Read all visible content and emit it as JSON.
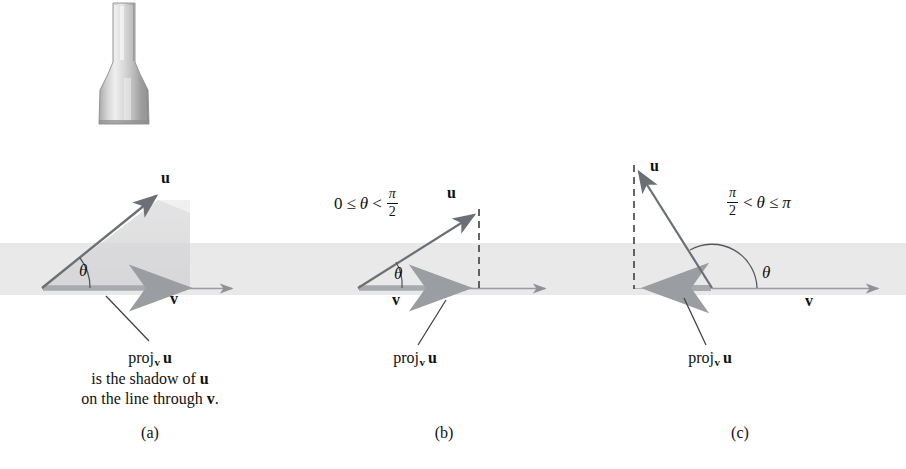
{
  "figure": {
    "colors": {
      "vector_u": "#6b6f76",
      "vector_v": "#8e9196",
      "projection": "#9a9da1",
      "band": "#e9e9ea",
      "text": "#111111",
      "dashed": "#3a3a3a"
    },
    "lamp": {
      "name": "flashlight-light-source"
    }
  },
  "panels": [
    {
      "id": "a",
      "letter": "(a)",
      "label_u": "u",
      "label_v": "v",
      "label_theta": "θ",
      "inequality": null,
      "has_dashed_drop_line": false,
      "projection_direction": "positive",
      "caption": {
        "proj_prefix": "proj",
        "proj_sub": "v",
        "proj_arg": "u",
        "line2": "is the shadow of u",
        "line3": "on the line through v."
      }
    },
    {
      "id": "b",
      "letter": "(b)",
      "label_u": "u",
      "label_v": "v",
      "label_theta": "θ",
      "inequality": {
        "lhs": "0",
        "rel1": "≤",
        "var": "θ",
        "rel2": "<",
        "rhs_num": "π",
        "rhs_den": "2"
      },
      "has_dashed_drop_line": true,
      "projection_direction": "positive",
      "caption": {
        "proj_prefix": "proj",
        "proj_sub": "v",
        "proj_arg": "u",
        "line2": null,
        "line3": null
      }
    },
    {
      "id": "c",
      "letter": "(c)",
      "label_u": "u",
      "label_v": "v",
      "label_theta": "θ",
      "inequality": {
        "lhs_num": "π",
        "lhs_den": "2",
        "rel1": "<",
        "var": "θ",
        "rel2": "≤",
        "rhs": "π"
      },
      "has_dashed_drop_line": true,
      "projection_direction": "negative",
      "caption": {
        "proj_prefix": "proj",
        "proj_sub": "v",
        "proj_arg": "u",
        "line2": null,
        "line3": null
      }
    }
  ]
}
